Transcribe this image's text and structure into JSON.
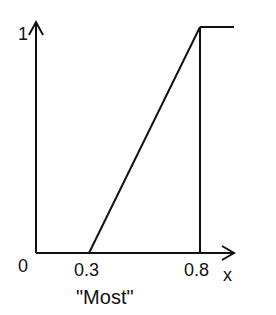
{
  "diagram": {
    "title": "\"Most\"",
    "type": "membership-function",
    "x_axis": {
      "label": "x",
      "origin_label": "0",
      "ticks": [
        "0.3",
        "0.8"
      ]
    },
    "y_axis": {
      "top_label": "1"
    },
    "function_points": [
      [
        0,
        0
      ],
      [
        0.3,
        0
      ],
      [
        0.8,
        1
      ],
      [
        1.0,
        1
      ]
    ],
    "colors": {
      "line": "#111111",
      "background": "#ffffff"
    }
  }
}
